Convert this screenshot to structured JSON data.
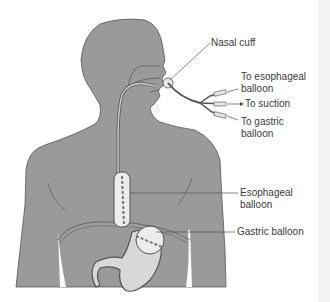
{
  "diagram": {
    "type": "anatomical-illustration",
    "colors": {
      "body_fill": "#9a9a9a",
      "outline": "#555555",
      "tube_fill": "#e4e4e4",
      "balloon_fill": "#ececec",
      "label_text": "#3a3a3a",
      "leader_line": "#555555"
    }
  },
  "labels": {
    "nasal_cuff": "Nasal cuff",
    "to_esophageal_balloon_line1": "To esophageal",
    "to_esophageal_balloon_line2": "balloon",
    "to_suction": "To suction",
    "to_gastric_balloon_line1": "To gastric",
    "to_gastric_balloon_line2": "balloon",
    "esophageal_balloon_line1": "Esophageal",
    "esophageal_balloon_line2": "balloon",
    "gastric_balloon": "Gastric balloon"
  }
}
